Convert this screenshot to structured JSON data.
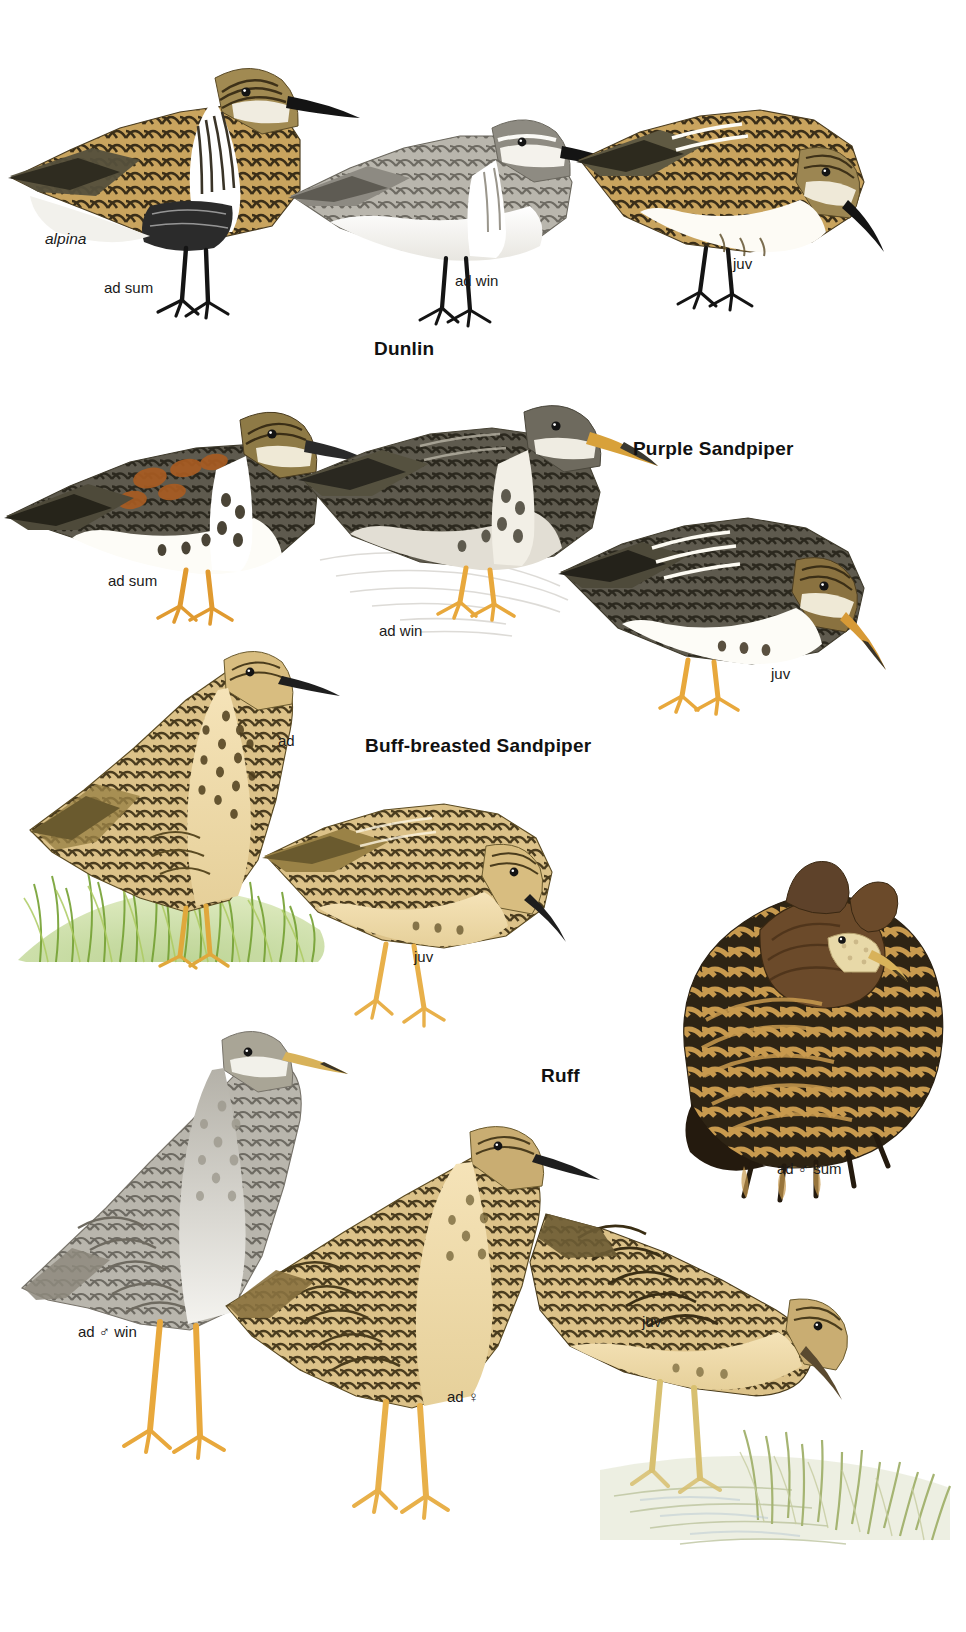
{
  "page": {
    "type": "field-guide-plate",
    "background_color": "#ffffff",
    "width": 966,
    "height": 1632
  },
  "species": [
    {
      "id": "dunlin",
      "name": "Dunlin",
      "name_position": {
        "x": 374,
        "y": 338
      },
      "subspecies": "alpina",
      "subspecies_position": {
        "x": 45,
        "y": 230
      },
      "figures": [
        {
          "id": "dunlin-ad-sum",
          "label": "ad sum",
          "label_position": {
            "x": 104,
            "y": 279
          },
          "pose": "standing-upright",
          "colors": {
            "mantle": "#a9823f",
            "wing": "#6f6446",
            "belly": "#ffffff",
            "bill": "#1a1a1a",
            "legs": "#1a1a1a",
            "breast_band": "#2b2b2b"
          }
        },
        {
          "id": "dunlin-ad-win",
          "label": "ad win",
          "label_position": {
            "x": 455,
            "y": 279
          },
          "pose": "crouched",
          "colors": {
            "mantle": "#9a9a96",
            "wing": "#8b8b86",
            "belly": "#ffffff",
            "bill": "#1a1a1a",
            "legs": "#1a1a1a"
          }
        },
        {
          "id": "dunlin-juv",
          "label": "juv",
          "label_position": {
            "x": 733,
            "y": 262
          },
          "pose": "feeding-bent",
          "colors": {
            "mantle": "#a8702f",
            "wing": "#6d5f41",
            "belly": "#fdfbf5",
            "bill": "#1a1a1a",
            "legs": "#1a1a1a"
          }
        }
      ]
    },
    {
      "id": "purple-sandpiper",
      "name": "Purple Sandpiper",
      "name_position": {
        "x": 633,
        "y": 440
      },
      "figures": [
        {
          "id": "purple-ad-sum",
          "label": "ad sum",
          "label_position": {
            "x": 108,
            "y": 572
          },
          "pose": "standing",
          "colors": {
            "mantle": "#9d5b22",
            "wing": "#5f5a4a",
            "belly": "#ffffff",
            "bill": "#2a2a2a",
            "legs": "#e8a33c"
          }
        },
        {
          "id": "purple-ad-win",
          "label": "ad win",
          "label_position": {
            "x": 379,
            "y": 625
          },
          "pose": "standing-on-rock",
          "colors": {
            "mantle": "#6e6a62",
            "wing": "#5a5650",
            "belly": "#ded9d2",
            "bill": "#d8a13a",
            "legs": "#e8a33c"
          }
        },
        {
          "id": "purple-juv",
          "label": "juv",
          "label_position": {
            "x": 771,
            "y": 672
          },
          "pose": "feeding-bent",
          "colors": {
            "mantle": "#8a6a32",
            "wing": "#4f4a3c",
            "belly": "#ffffff",
            "bill": "#d79a36",
            "legs": "#e8a33c"
          }
        }
      ]
    },
    {
      "id": "buff-breasted-sandpiper",
      "name": "Buff-breasted Sandpiper",
      "name_position": {
        "x": 365,
        "y": 738
      },
      "figures": [
        {
          "id": "buff-ad",
          "label": "ad",
          "label_position": {
            "x": 278,
            "y": 734
          },
          "pose": "standing-upright-grass",
          "colors": {
            "mantle": "#c9a košt",
            "wing": "#8a7240",
            "belly": "#f0d9a8",
            "bill": "#2a2a2a",
            "legs": "#e0a83c"
          }
        },
        {
          "id": "buff-juv",
          "label": "juv",
          "label_position": {
            "x": 414,
            "y": 956
          },
          "pose": "feeding-bent",
          "colors": {
            "mantle": "#c2a25e",
            "wing": "#7d6a3c",
            "belly": "#f2dcae",
            "bill": "#2a2a2a",
            "legs": "#e8b04a"
          }
        }
      ],
      "habitat": {
        "type": "grass-tuft",
        "color": "#8fb83f",
        "position": {
          "x": 20,
          "y": 865
        }
      }
    },
    {
      "id": "ruff",
      "name": "Ruff",
      "name_position": {
        "x": 541,
        "y": 1068
      },
      "figures": [
        {
          "id": "ruff-ad-male-sum",
          "label": "ad ♂ sum",
          "label_position": {
            "x": 777,
            "y": 1163
          },
          "pose": "displaying-ruff",
          "colors": {
            "ruff": "#6b4a2a",
            "body": "#3a2c18",
            "barring": "#c79a4e",
            "bill": "#d8b25a",
            "face": "#e8d9a8"
          }
        },
        {
          "id": "ruff-ad-male-win",
          "label": "ad ♂ win",
          "label_position": {
            "x": 78,
            "y": 1331
          },
          "pose": "standing-upright",
          "colors": {
            "mantle": "#a39a86",
            "wing": "#8e8573",
            "belly": "#f2f0ea",
            "bill": "#d8b25a",
            "legs": "#e8a83c"
          }
        },
        {
          "id": "ruff-ad-female",
          "label": "ad ♀",
          "label_position": {
            "x": 447,
            "y": 1396
          },
          "pose": "standing",
          "colors": {
            "mantle": "#b29a62",
            "wing": "#6d5c34",
            "belly": "#e8d8b0",
            "bill": "#2a2a2a",
            "legs": "#e8b04a"
          }
        },
        {
          "id": "ruff-juv",
          "label": "juv",
          "label_position": {
            "x": 642,
            "y": 1321
          },
          "pose": "feeding-bent-water",
          "colors": {
            "mantle": "#c3a45c",
            "wing": "#5e4f2c",
            "belly": "#efdcb2",
            "bill": "#5a4a30",
            "legs": "#d8c070"
          }
        }
      ],
      "habitat": {
        "type": "marsh-water-grass",
        "color": "#b9c089",
        "position": {
          "x": 620,
          "y": 1430
        }
      }
    }
  ]
}
